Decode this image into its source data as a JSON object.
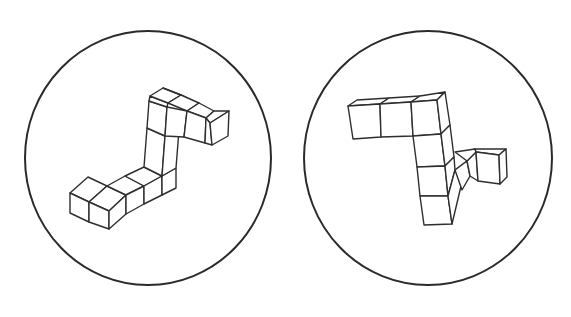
{
  "figures": [
    {
      "id": "left",
      "description": "Isometric polycube shape (S/Z-like, 10 unit cubes) drawn inside a circle",
      "circle": {
        "cx": 148,
        "cy": 158,
        "rx": 123,
        "ry": 127
      },
      "cube_count": 10,
      "faces": [
        "70,193 88,177 107,186 89,202",
        "89,202 107,186 126,195 109,211",
        "70,193 89,202 89,222 70,213",
        "89,202 109,211 109,229 89,222",
        "109,211 126,195 126,214 109,229",
        "107,186 125,176 144,186 126,195",
        "125,176 144,167 162,176 144,186",
        "126,195 144,186 144,204 126,214",
        "144,186 162,176 162,195 144,204",
        "162,176 176,168 176,188 162,195",
        "144,167 147,128 165,136 162,176",
        "147,128 149,101 167,107 165,136",
        "162,176 165,136 179,130 176,168",
        "149,101 150,96 168,103 167,107",
        "150,96 163,88 181,95 168,103",
        "163,88 181,95 197,103 181,95",
        "168,103 181,95 199,103 187,111",
        "187,111 199,103 214,111 206,118",
        "206,118 214,111 229,111 210,123",
        "167,107 187,111 184,137 165,136",
        "187,111 206,118 205,143 184,137",
        "206,118 210,123 212,145 205,143",
        "210,123 229,111 228,136 212,145"
      ]
    },
    {
      "id": "right",
      "description": "Isometric polycube shape (Z-like with side branch, 10 unit cubes) drawn inside a circle",
      "circle": {
        "cx": 428,
        "cy": 158,
        "rx": 124,
        "ry": 127
      },
      "cube_count": 10,
      "faces": [
        "348,106 357,100 389,98 380,104",
        "380,104 389,98 420,96 411,102",
        "411,102 420,96 445,92 437,100",
        "348,106 380,104 381,137 353,139",
        "380,104 411,102 413,136 381,137",
        "411,102 437,100 441,134 413,136",
        "437,100 445,92 450,125 441,134",
        "413,136 441,134 445,166 417,167",
        "441,134 450,125 454,157 445,166",
        "417,167 445,166 448,196 420,196",
        "445,166 454,157 455,170 448,196",
        "420,196 448,196 452,224 424,225",
        "448,196 455,170 467,161 452,224",
        "455,170 467,161 470,176 462,190",
        "467,161 476,152 478,181 470,176",
        "455,152 475,149 476,152 467,161",
        "475,149 506,149 499,155 476,152",
        "476,152 499,155 500,184 478,181",
        "499,155 506,149 507,177 500,184"
      ]
    }
  ],
  "colors": {
    "background": "#ffffff",
    "stroke": "#2e2e2e",
    "circle": "#2a2a2a"
  }
}
